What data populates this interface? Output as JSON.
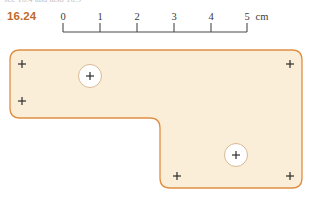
{
  "figure": {
    "cutoff_text_fragment": "sec 16.4 and also 16.9",
    "problem_number": "16.24"
  },
  "scale": {
    "name": "scale-bar",
    "unit_label": "cm",
    "ticks": [
      {
        "label": "0",
        "value": 0,
        "x": 63
      },
      {
        "label": "1",
        "value": 1,
        "x": 100
      },
      {
        "label": "2",
        "value": 2,
        "x": 137
      },
      {
        "label": "3",
        "value": 3,
        "x": 174
      },
      {
        "label": "4",
        "value": 4,
        "x": 211
      },
      {
        "label": "5",
        "value": 5,
        "x": 247
      }
    ],
    "axis_y": 32,
    "tick_height": 9,
    "line_color": "#4a4a4a",
    "unit_label_x": 262,
    "unit_label_y": 11
  },
  "chart_data": {
    "type": "diagram",
    "xlabel": "",
    "ylabel": "",
    "units": "cm",
    "scale_px_per_cm": 36.8,
    "outline_points_px": [
      [
        10,
        50
      ],
      [
        302,
        50
      ],
      [
        302,
        188
      ],
      [
        160,
        188
      ],
      [
        160,
        118
      ],
      [
        10,
        118
      ]
    ],
    "corner_radius_px": 10,
    "fill_color": "#fbeed8",
    "stroke_color": "#e08e42",
    "holes": [
      {
        "name": "hole-upper-left",
        "cx": 90,
        "cy": 76,
        "r": 11.5
      },
      {
        "name": "hole-lower-right",
        "cx": 236,
        "cy": 155,
        "r": 11.5
      }
    ],
    "cross_marks": [
      {
        "name": "cross-top-left",
        "cx": 22,
        "cy": 64
      },
      {
        "name": "cross-mid-left",
        "cx": 22,
        "cy": 101
      },
      {
        "name": "cross-top-right",
        "cx": 290,
        "cy": 64
      },
      {
        "name": "cross-bottom-left-arm",
        "cx": 177,
        "cy": 176
      },
      {
        "name": "cross-bottom-right",
        "cx": 290,
        "cy": 176
      }
    ],
    "cross_size_px": 8,
    "cross_color": "#2d2d2d"
  }
}
